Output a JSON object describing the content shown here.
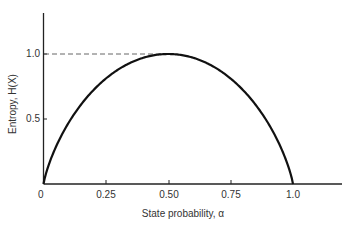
{
  "chart_data": {
    "type": "line",
    "title": "",
    "xlabel": "State probability, α",
    "ylabel": "Entropy, H(X)",
    "xlim": [
      0,
      1.2
    ],
    "ylim": [
      0,
      1.2
    ],
    "x_ticks": [
      "0",
      "0.25",
      "0.50",
      "0.75",
      "1.0"
    ],
    "y_ticks": [
      "0.5",
      "1.0"
    ],
    "grid": false,
    "legend": null,
    "series": [
      {
        "name": "H(X) = -α log2 α - (1-α) log2 (1-α)",
        "x": [
          0,
          0.05,
          0.1,
          0.15,
          0.2,
          0.25,
          0.3,
          0.35,
          0.4,
          0.45,
          0.5,
          0.55,
          0.6,
          0.65,
          0.7,
          0.75,
          0.8,
          0.85,
          0.9,
          0.95,
          1.0
        ],
        "values": [
          0,
          0.29,
          0.47,
          0.61,
          0.72,
          0.81,
          0.88,
          0.93,
          0.97,
          0.99,
          1.0,
          0.99,
          0.97,
          0.93,
          0.88,
          0.81,
          0.72,
          0.61,
          0.47,
          0.29,
          0
        ]
      }
    ],
    "annotations": [
      {
        "type": "dashed-line",
        "from": [
          0,
          1.0
        ],
        "to": [
          0.5,
          1.0
        ],
        "label": "maximum entropy at α = 0.5"
      }
    ]
  },
  "labels": {
    "x_axis": "State probability, α",
    "y_axis": "Entropy, H(X)",
    "x_tick_0": "0",
    "x_tick_1": "0.25",
    "x_tick_2": "0.50",
    "x_tick_3": "0.75",
    "x_tick_4": "1.0",
    "y_tick_1": "0.5",
    "y_tick_2": "1.0"
  },
  "colors": {
    "curve": "#111111",
    "axis": "#222222",
    "dashed": "#555555"
  }
}
